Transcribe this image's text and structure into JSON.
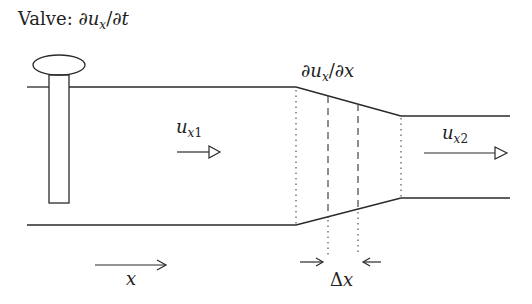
{
  "diagram": {
    "title": {
      "prefix": "Valve: ",
      "expr_partial": "∂",
      "expr_u": "u",
      "expr_sub": "x",
      "expr_rest": "/∂",
      "expr_t": "t"
    },
    "gradient_label": {
      "partial": "∂",
      "u": "u",
      "sub": "x",
      "slash": "/∂",
      "x": "x"
    },
    "velocity_in": {
      "u": "u",
      "sub_x": "x",
      "sub_n": "1"
    },
    "velocity_out": {
      "u": "u",
      "sub_x": "x",
      "sub_n": "2"
    },
    "delta_label": {
      "delta": "Δ",
      "x": "x"
    },
    "axis_label": "x",
    "components": [
      "valve (handle + stem)",
      "wide pipe section",
      "converging section",
      "narrow pipe section",
      "control volume Δx (dashed)",
      "flow arrow u_x1",
      "flow arrow u_x2",
      "axis arrow x"
    ],
    "colors": {
      "stroke": "#222222",
      "background": "#ffffff"
    }
  }
}
